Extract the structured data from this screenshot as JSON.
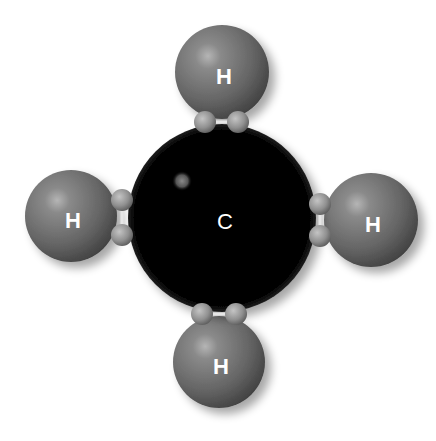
{
  "diagram": {
    "colors": {
      "background": "#ffffff",
      "carbon": "#050505",
      "hydrogen": "#6e6e6e",
      "hydrogen_highlight": "#a8a8a8",
      "electron": "#9a9a9a",
      "label": "#ffffff"
    },
    "carbon": {
      "label": "C",
      "cx": 222,
      "cy": 218,
      "r": 94
    },
    "hydrogens": [
      {
        "id": "top",
        "label": "H",
        "cx": 222,
        "cy": 72,
        "r": 47
      },
      {
        "id": "left",
        "label": "H",
        "cx": 71,
        "cy": 216,
        "r": 46
      },
      {
        "id": "right",
        "label": "H",
        "cx": 371,
        "cy": 220,
        "r": 47
      },
      {
        "id": "bottom",
        "label": "H",
        "cx": 219,
        "cy": 362,
        "r": 46
      }
    ],
    "electron_pairs": [
      {
        "bond": "top",
        "electrons": [
          {
            "cx": 205,
            "cy": 122
          },
          {
            "cx": 238,
            "cy": 122
          }
        ]
      },
      {
        "bond": "left",
        "electrons": [
          {
            "cx": 122,
            "cy": 200
          },
          {
            "cx": 122,
            "cy": 235
          }
        ]
      },
      {
        "bond": "right",
        "electrons": [
          {
            "cx": 320,
            "cy": 204
          },
          {
            "cx": 320,
            "cy": 236
          }
        ]
      },
      {
        "bond": "bottom",
        "electrons": [
          {
            "cx": 202,
            "cy": 314
          },
          {
            "cx": 236,
            "cy": 314
          }
        ]
      }
    ]
  }
}
